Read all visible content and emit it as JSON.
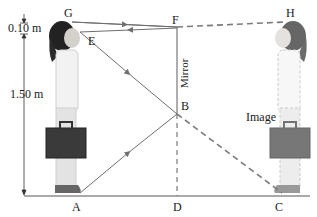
{
  "diagram": {
    "points": {
      "G": "G",
      "E": "E",
      "F": "F",
      "H": "H",
      "B": "B",
      "A": "A",
      "D": "D",
      "C": "C"
    },
    "labels": {
      "mirror": "Mirror",
      "image": "Image",
      "dim_top": "0.10 m",
      "dim_height": "1.50 m"
    },
    "colors": {
      "ray": "#6e6e6e",
      "mirror": "#9a9a9a",
      "dashed": "#7a7a7a",
      "floor": "#555555",
      "text": "#1a1a1a"
    }
  }
}
